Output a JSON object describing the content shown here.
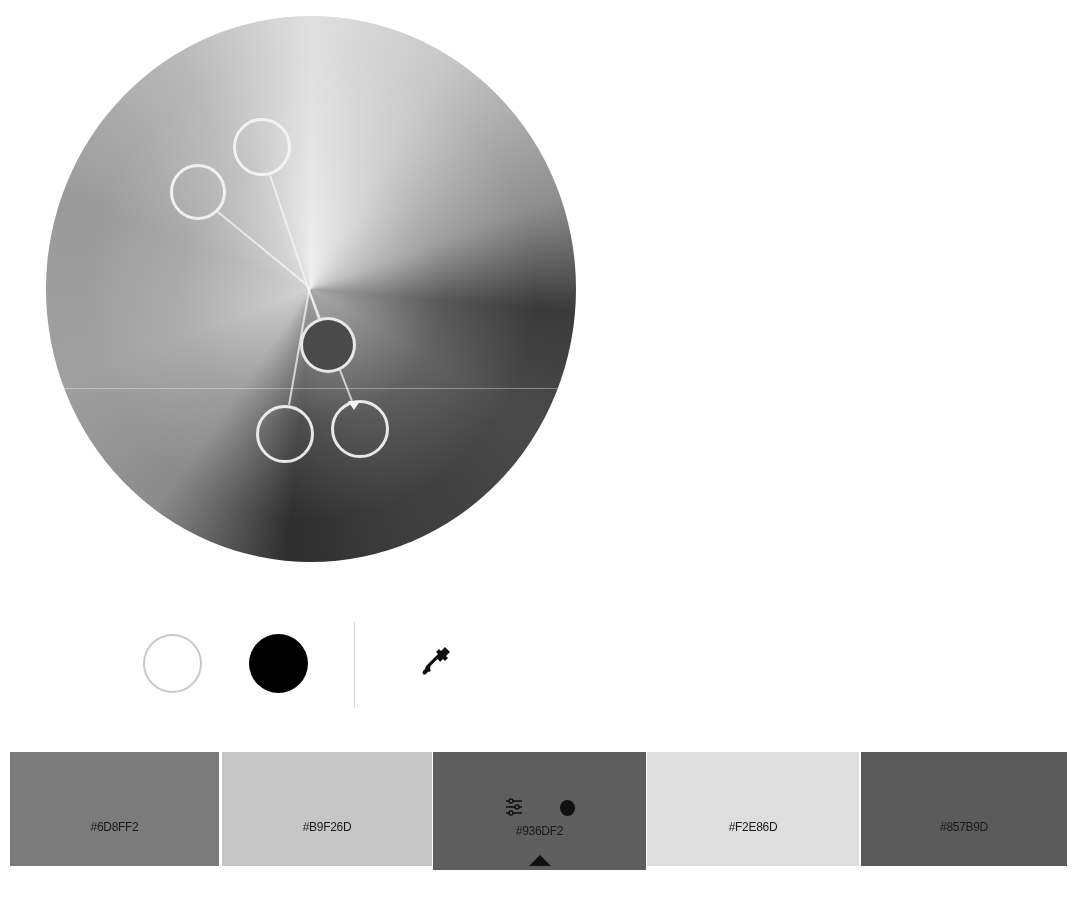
{
  "wheel": {
    "handles": [
      {
        "name": "handle-1",
        "cx": 262,
        "cy": 147,
        "r": 29,
        "base": false
      },
      {
        "name": "handle-2",
        "cx": 198,
        "cy": 192,
        "r": 28,
        "base": false
      },
      {
        "name": "handle-base",
        "cx": 328,
        "cy": 345,
        "r": 28,
        "base": true
      },
      {
        "name": "handle-4",
        "cx": 285,
        "cy": 434,
        "r": 29,
        "base": false
      },
      {
        "name": "handle-5",
        "cx": 360,
        "cy": 429,
        "r": 29,
        "base": false,
        "marker": true
      }
    ],
    "center": {
      "x": 307,
      "y": 285
    }
  },
  "tools": {
    "white_icon": "circle-outline",
    "black_icon": "circle-filled",
    "eyedropper_icon": "eyedropper"
  },
  "swatches": [
    {
      "hex": "#6D8FF2",
      "gray": "#7b7b7b",
      "left": 10,
      "width": 209,
      "selected": false
    },
    {
      "hex": "#B9F26D",
      "gray": "#c6c6c6",
      "left": 222,
      "width": 210,
      "selected": false
    },
    {
      "hex": "#936DF2",
      "gray": "#5e5e5e",
      "left": 433,
      "width": 213,
      "selected": true
    },
    {
      "hex": "#F2E86D",
      "gray": "#dedede",
      "left": 647,
      "width": 212,
      "selected": false
    },
    {
      "hex": "#857B9D",
      "gray": "#5b5b5b",
      "left": 861,
      "width": 206,
      "selected": false
    }
  ],
  "selected_swatch_tools": {
    "adjust_icon": "sliders",
    "dot_icon": "circle-filled",
    "base_marker_icon": "triangle-up"
  }
}
